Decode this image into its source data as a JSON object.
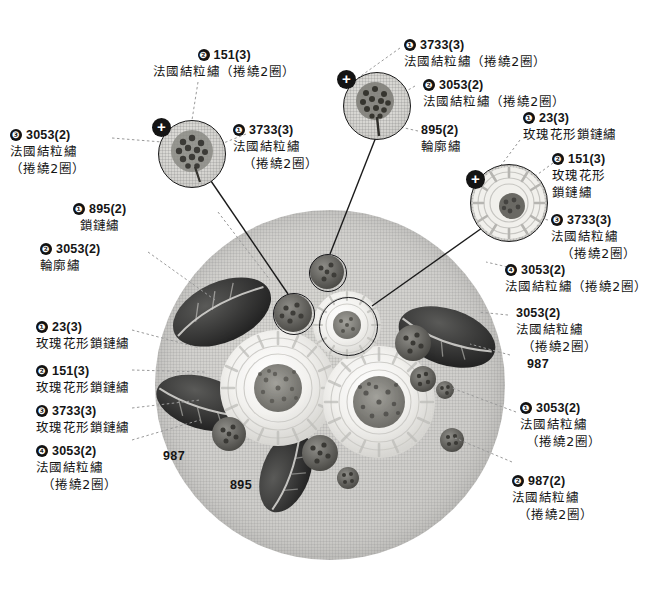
{
  "diagram": {
    "fabric_color": "#cfcecb",
    "ink_color": "#151515"
  },
  "zoom_bubbles": [
    {
      "name": "bubble-left",
      "plus": "✚"
    },
    {
      "name": "bubble-top",
      "plus": "✚"
    },
    {
      "name": "bubble-right",
      "plus": "✚"
    }
  ],
  "labels": {
    "top_left_151": {
      "bullet": "❷",
      "code": "151(3)",
      "desc": "法國結粒繡（捲繞2圈）"
    },
    "top_left_3053": {
      "bullet": "❸",
      "code": "3053(2)",
      "desc1": "法國結粒繡",
      "desc2": "（捲繞2圈）"
    },
    "upper_mid_3733": {
      "bullet": "❶",
      "code": "3733(3)",
      "desc1": "法國結粒繡",
      "desc2": "（捲繞2圈）"
    },
    "top_right_3733": {
      "bullet": "❶",
      "code": "3733(3)",
      "desc": "法國結粒繡（捲繞2圈）"
    },
    "top_right_3053": {
      "bullet": "❷",
      "code": "3053(2)",
      "desc": "法國結粒繡（捲繞2圈）"
    },
    "mid_895": {
      "bullet": "",
      "code": "895(2)",
      "desc": "輪廓繡"
    },
    "right_23": {
      "bullet": "❶",
      "code": "23(3)",
      "desc": "玫瑰花形鎖鏈繡"
    },
    "right_151": {
      "bullet": "❷",
      "code": "151(3)",
      "desc1": "玫瑰花形",
      "desc2": "鎖鏈繡"
    },
    "right_3733": {
      "bullet": "❸",
      "code": "3733(3)",
      "desc1": "法國結粒繡",
      "desc2": "（捲繞2圈）"
    },
    "right_3053_4": {
      "bullet": "❹",
      "code": "3053(2)",
      "desc": "法國結粒繡（捲繞2圈）"
    },
    "right_3053_plain": {
      "bullet": "",
      "code": "3053(2)",
      "desc1": "法國結粒繡",
      "desc2": "（捲繞2圈）"
    },
    "right_987_plain": {
      "bullet": "",
      "code": "987",
      "desc": ""
    },
    "right_lower_3053": {
      "bullet": "❶",
      "code": "3053(2)",
      "desc1": "法國結粒繡",
      "desc2": "（捲繞2圈）"
    },
    "right_lower_987": {
      "bullet": "❷",
      "code": "987(2)",
      "desc1": "法國結粒繡",
      "desc2": "（捲繞2圈）"
    },
    "left_895": {
      "bullet": "❶",
      "code": "895(2)",
      "desc": "鎖鏈繡"
    },
    "left_3053_outline": {
      "bullet": "❷",
      "code": "3053(2)",
      "desc": "輪廓繡"
    },
    "left_23": {
      "bullet": "❶",
      "code": "23(3)",
      "desc": "玫瑰花形鎖鏈繡"
    },
    "left_151": {
      "bullet": "❷",
      "code": "151(3)",
      "desc": "玫瑰花形鎖鏈繡"
    },
    "left_3733": {
      "bullet": "❸",
      "code": "3733(3)",
      "desc": "玫瑰花形鎖鏈繡"
    },
    "left_3053_knot": {
      "bullet": "❹",
      "code": "3053(2)",
      "desc1": "法國結粒繡",
      "desc2": "（捲繞2圈）"
    }
  },
  "fabric_marks": {
    "mark_987": "987",
    "mark_895": "895"
  }
}
